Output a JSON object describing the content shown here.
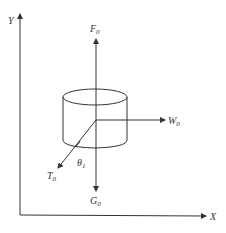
{
  "diagram": {
    "type": "force-diagram",
    "axes": {
      "x_label": "X",
      "y_label": "Y"
    },
    "forces": [
      {
        "name": "F",
        "subscript": "0",
        "direction": "up"
      },
      {
        "name": "G",
        "subscript": "0",
        "direction": "down"
      },
      {
        "name": "W",
        "subscript": "0",
        "direction": "right"
      },
      {
        "name": "T",
        "subscript": "0",
        "direction": "down-left"
      }
    ],
    "angle": {
      "name": "θ",
      "subscript": "1"
    },
    "body": "cylinder",
    "colors": {
      "line": "#333333",
      "background": "#ffffff"
    }
  }
}
